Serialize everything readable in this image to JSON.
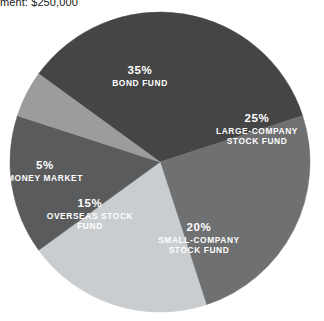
{
  "caption": {
    "text": "ment: $250,000"
  },
  "chart_data": {
    "type": "pie",
    "title": "",
    "categories": [
      "BOND FUND",
      "LARGE-COMPANY STOCK FUND",
      "SMALL-COMPANY STOCK FUND",
      "OVERSEAS STOCK FUND",
      "MONEY MARKET"
    ],
    "values": [
      35,
      25,
      20,
      15,
      5
    ],
    "value_unit": "%",
    "legend": "none",
    "grid": false,
    "slices": [
      {
        "name": "BOND FUND",
        "percent_label": "35%",
        "value": 35,
        "color": "#454546",
        "label_lines": [
          "BOND FUND"
        ],
        "label_x": 140,
        "label_y": 74,
        "text_color": "#ffffff"
      },
      {
        "name": "LARGE-COMPANY STOCK FUND",
        "percent_label": "25%",
        "value": 25,
        "color": "#6f7072",
        "label_lines": [
          "LARGE-COMPANY",
          "STOCK FUND"
        ],
        "label_x": 257,
        "label_y": 122,
        "text_color": "#ffffff"
      },
      {
        "name": "SMALL-COMPANY STOCK FUND",
        "percent_label": "20%",
        "value": 20,
        "color": "#c9cdcf",
        "label_lines": [
          "SMALL-COMPANY",
          "STOCK FUND"
        ],
        "label_x": 199,
        "label_y": 231,
        "text_color": "#ffffff"
      },
      {
        "name": "OVERSEAS STOCK FUND",
        "percent_label": "15%",
        "value": 15,
        "color": "#5a5b5c",
        "label_lines": [
          "OVERSEAS STOCK",
          "FUND"
        ],
        "label_x": 90,
        "label_y": 207,
        "text_color": "#ffffff"
      },
      {
        "name": "MONEY MARKET",
        "percent_label": "5%",
        "value": 5,
        "color": "#9a9c9d",
        "label_lines": [
          "MONEY MARKET"
        ],
        "label_x": 45,
        "label_y": 169,
        "text_color": "#ffffff"
      }
    ],
    "geometry": {
      "center_x": 160,
      "center_y": 162,
      "radius": 150,
      "start_angle_deg": -54
    }
  }
}
